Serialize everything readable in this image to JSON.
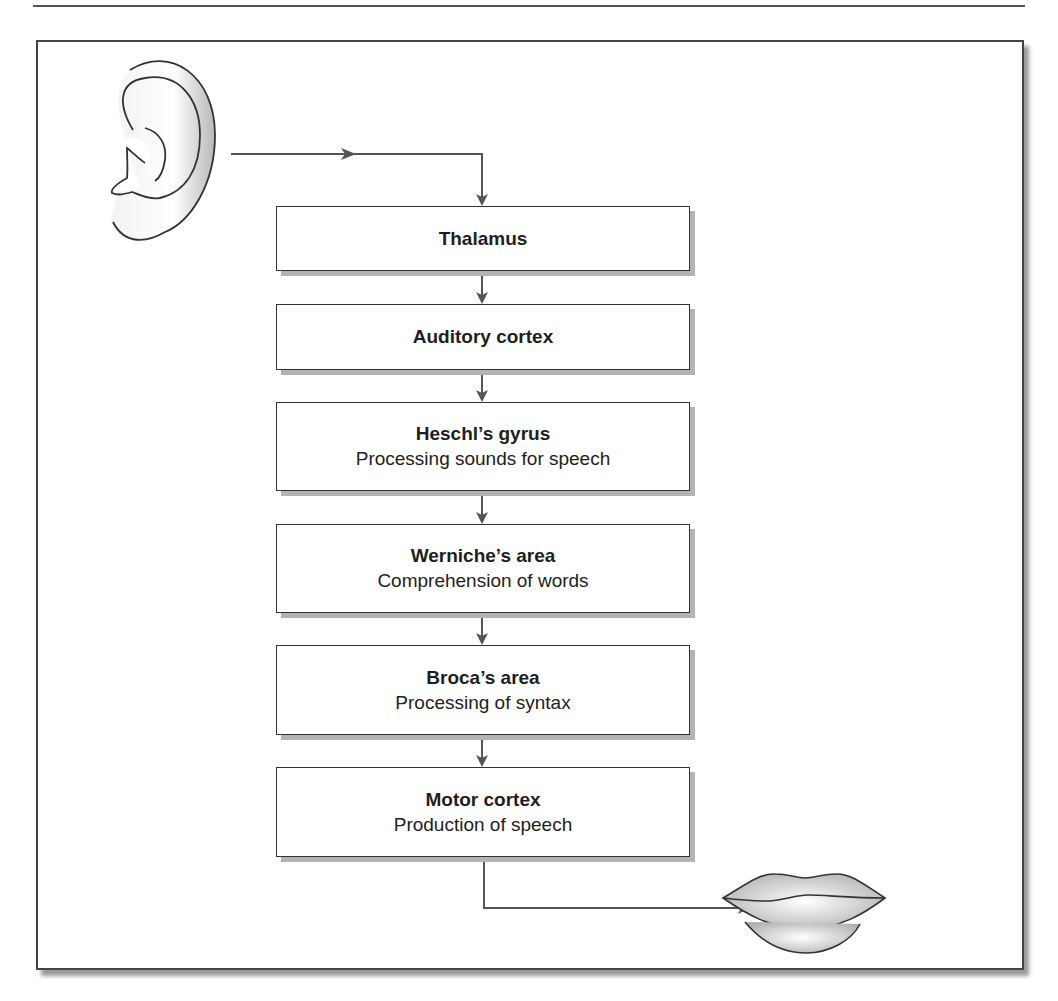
{
  "diagram": {
    "type": "flowchart",
    "direction": "top-to-bottom",
    "start_icon": "ear-icon",
    "end_icon": "lips-icon",
    "nodes": [
      {
        "id": "thalamus",
        "title": "Thalamus",
        "subtitle": ""
      },
      {
        "id": "auditory-cortex",
        "title": "Auditory cortex",
        "subtitle": ""
      },
      {
        "id": "heschls-gyrus",
        "title": "Heschl’s gyrus",
        "subtitle": "Processing sounds for speech"
      },
      {
        "id": "werniches-area",
        "title": "Werniche’s area",
        "subtitle": "Comprehension of words"
      },
      {
        "id": "brocas-area",
        "title": "Broca’s area",
        "subtitle": "Processing of syntax"
      },
      {
        "id": "motor-cortex",
        "title": "Motor cortex",
        "subtitle": "Production of speech"
      }
    ],
    "edges": [
      {
        "from": "ear",
        "to": "thalamus"
      },
      {
        "from": "thalamus",
        "to": "auditory-cortex"
      },
      {
        "from": "auditory-cortex",
        "to": "heschls-gyrus"
      },
      {
        "from": "heschls-gyrus",
        "to": "werniches-area"
      },
      {
        "from": "werniches-area",
        "to": "brocas-area"
      },
      {
        "from": "brocas-area",
        "to": "motor-cortex"
      },
      {
        "from": "motor-cortex",
        "to": "lips"
      }
    ]
  },
  "colors": {
    "line": "#555555",
    "box_border": "#333333",
    "shadow": "#b3b3b3"
  }
}
